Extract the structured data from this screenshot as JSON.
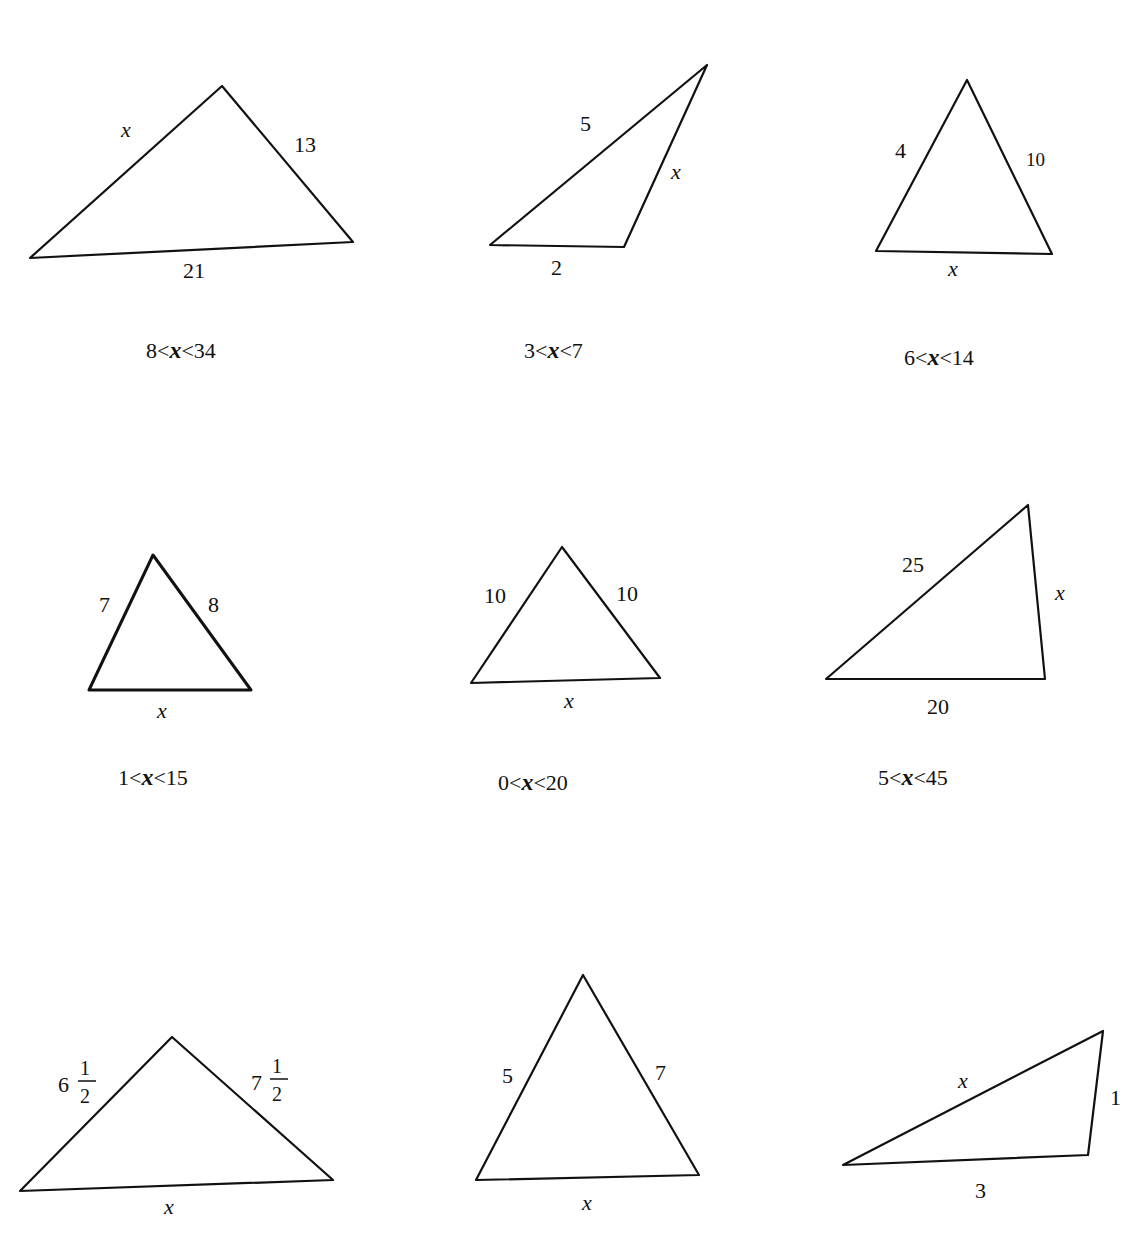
{
  "page": {
    "header_fragment": "(clipped header text at top edge)"
  },
  "figures": [
    {
      "id": 1,
      "vertices": [
        [
          30,
          258
        ],
        [
          222,
          86
        ],
        [
          353,
          242
        ]
      ],
      "labels": {
        "a": "x",
        "b": "13",
        "c": "21"
      },
      "range": {
        "low": "8",
        "var": "x",
        "high": "34"
      }
    },
    {
      "id": 2,
      "vertices": [
        [
          490,
          245
        ],
        [
          707,
          65
        ],
        [
          624,
          247
        ]
      ],
      "labels": {
        "a": "5",
        "b": "x",
        "c": "2"
      },
      "range": {
        "low": "3",
        "var": "x",
        "high": "7"
      }
    },
    {
      "id": 3,
      "vertices": [
        [
          876,
          251
        ],
        [
          967,
          80
        ],
        [
          1052,
          254
        ]
      ],
      "labels": {
        "a": "4",
        "b": "10",
        "c": "x"
      },
      "range": {
        "low": "6",
        "var": "x",
        "high": "14"
      }
    },
    {
      "id": 4,
      "vertices": [
        [
          89,
          690
        ],
        [
          153,
          555
        ],
        [
          251,
          690
        ]
      ],
      "labels": {
        "a": "7",
        "b": "8",
        "c": "x"
      },
      "range": {
        "low": "1",
        "var": "x",
        "high": "15"
      }
    },
    {
      "id": 5,
      "vertices": [
        [
          471,
          683
        ],
        [
          562,
          547
        ],
        [
          660,
          678
        ]
      ],
      "labels": {
        "a": "10",
        "b": "10",
        "c": "x"
      },
      "range": {
        "low": "0",
        "var": "x",
        "high": "20"
      }
    },
    {
      "id": 6,
      "vertices": [
        [
          826,
          679
        ],
        [
          1028,
          505
        ],
        [
          1045,
          679
        ]
      ],
      "labels": {
        "a": "25",
        "b": "x",
        "c": "20"
      },
      "range": {
        "low": "5",
        "var": "x",
        "high": "45"
      }
    },
    {
      "id": 7,
      "vertices": [
        [
          20,
          1191
        ],
        [
          172,
          1037
        ],
        [
          333,
          1180
        ]
      ],
      "labels": {
        "a_whole": "6",
        "a_num": "1",
        "a_den": "2",
        "b_whole": "7",
        "b_num": "1",
        "b_den": "2",
        "c": "x"
      }
    },
    {
      "id": 8,
      "vertices": [
        [
          476,
          1180
        ],
        [
          583,
          975
        ],
        [
          699,
          1175
        ]
      ],
      "labels": {
        "a": "5",
        "b": "7",
        "c": "x"
      }
    },
    {
      "id": 9,
      "vertices": [
        [
          843,
          1165
        ],
        [
          1103,
          1031
        ],
        [
          1088,
          1155
        ]
      ],
      "labels": {
        "a": "x",
        "b": "1",
        "c": "3"
      }
    }
  ],
  "range_symbols": {
    "lt": "<"
  }
}
